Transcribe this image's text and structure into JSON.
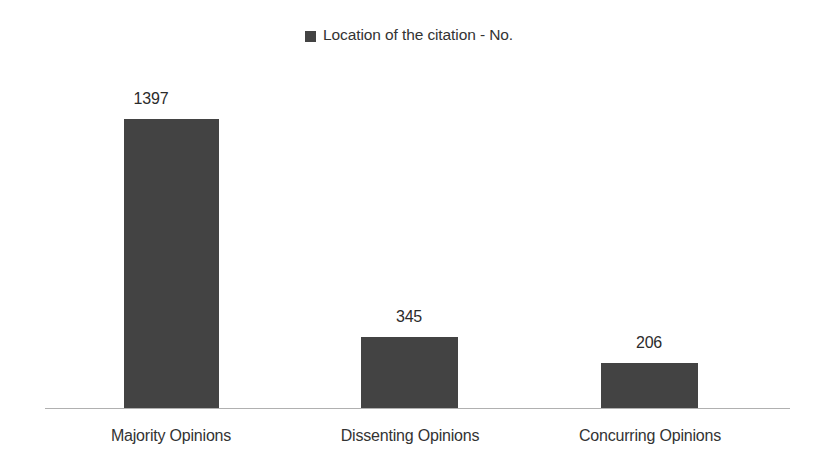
{
  "legend": {
    "marker_name": "legend-swatch-icon",
    "marker_color": "#434343",
    "label": "Location of the citation - No."
  },
  "chart_data": {
    "type": "bar",
    "title": "",
    "subtitle": "",
    "xlabel": "",
    "ylabel": "",
    "categories": [
      "Majority Opinions",
      "Dissenting Opinions",
      "Concurring Opinions"
    ],
    "values": [
      1397,
      345,
      206
    ],
    "series": [
      {
        "name": "Location of the citation - No.",
        "color": "#434343",
        "values": [
          1397,
          345,
          206
        ]
      }
    ],
    "data_labels": [
      "1397",
      "345",
      "206"
    ],
    "ylim": [
      0,
      1397
    ],
    "grid": false,
    "y_axis_visible": false,
    "x_axis_visible": true,
    "x_axis_color": "#b0b0b0",
    "legend_position": "top-center",
    "orientation": "vertical",
    "background": "#ffffff"
  },
  "bars": [
    {
      "category": "Majority Opinions",
      "value": 1397,
      "label": "1397",
      "left": 124,
      "width": 95,
      "height": 289,
      "label_left": 71,
      "label_top": 90
    },
    {
      "category": "Dissenting Opinions",
      "value": 345,
      "label": "345",
      "left": 361,
      "width": 97,
      "height": 71,
      "label_left": 329,
      "label_top": 308
    },
    {
      "category": "Concurring Opinions",
      "value": 206,
      "label": "206",
      "left": 601,
      "width": 97,
      "height": 45,
      "label_left": 569,
      "label_top": 334
    }
  ],
  "category_labels": [
    {
      "text": "Majority Opinions",
      "left": 41
    },
    {
      "text": "Dissenting Opinions",
      "left": 280
    },
    {
      "text": "Concurring Opinions",
      "left": 520
    }
  ]
}
